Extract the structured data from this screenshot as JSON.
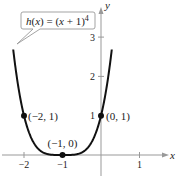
{
  "chart_data": {
    "type": "line",
    "title": "",
    "function_label": "h(x) = (x + 1)^4",
    "function_label_parts": {
      "name": "h",
      "arg": "x",
      "rhs": "(x + 1)",
      "exp": "4"
    },
    "xlabel": "x",
    "ylabel": "y",
    "xlim": [
      -2.65,
      1.9
    ],
    "ylim": [
      -0.6,
      3.9
    ],
    "x_ticks": [
      -2,
      -1,
      1
    ],
    "x_tick_labels": [
      "−2",
      "−1",
      "1"
    ],
    "y_ticks": [
      1,
      2,
      3
    ],
    "y_tick_labels": [
      "1",
      "2",
      "3"
    ],
    "grid": false,
    "series": [
      {
        "name": "h(x) = (x + 1)^4",
        "expression": "(x+1)^4",
        "color": "#111111"
      }
    ],
    "points": [
      {
        "x": -2,
        "y": 1,
        "label": "(−2, 1)"
      },
      {
        "x": -1,
        "y": 0,
        "label": "(−1, 0)"
      },
      {
        "x": 0,
        "y": 1,
        "label": "(0, 1)"
      }
    ],
    "colors": {
      "curve": "#111111",
      "axis": "#999999",
      "text": "#222222",
      "callout_border": "#999999"
    }
  }
}
